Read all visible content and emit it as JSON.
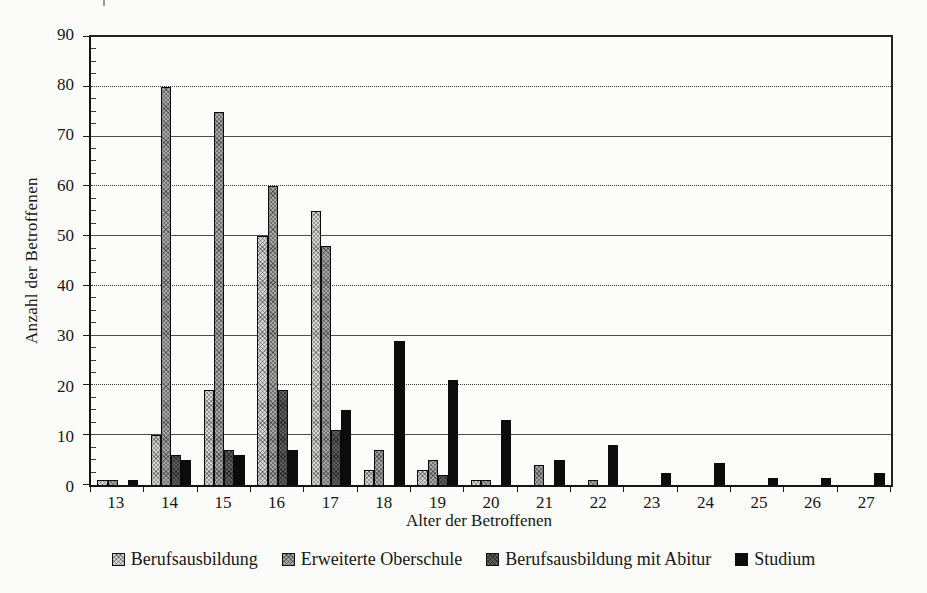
{
  "chart_data": {
    "type": "bar",
    "title": "",
    "xlabel": "Alter der Betroffenen",
    "ylabel": "Anzahl der Betroffenen",
    "categories": [
      "13",
      "14",
      "15",
      "16",
      "17",
      "18",
      "19",
      "20",
      "21",
      "22",
      "23",
      "24",
      "25",
      "26",
      "27"
    ],
    "series": [
      {
        "name": "Berufsausbildung",
        "color": "#d2d2d2",
        "values": [
          1,
          10,
          19,
          50,
          55,
          3,
          3,
          1,
          0,
          0,
          0,
          0,
          0,
          0,
          0
        ]
      },
      {
        "name": "Erweiterte Oberschule",
        "color": "#9b9b9b",
        "values": [
          1,
          80,
          75,
          60,
          48,
          7,
          5,
          1,
          4,
          1,
          0,
          0,
          0,
          0,
          0
        ]
      },
      {
        "name": "Berufsausbildung mit Abitur",
        "color": "#4a4a4a",
        "values": [
          0,
          6,
          7,
          19,
          11,
          0,
          2,
          0,
          0,
          0,
          0,
          0,
          0,
          0,
          0
        ]
      },
      {
        "name": "Studium",
        "color": "#0c0c0c",
        "values": [
          1,
          5,
          6,
          7,
          15,
          29,
          21,
          13,
          5,
          8,
          2.5,
          4.5,
          1.5,
          1.5,
          2.5
        ]
      }
    ],
    "ylim": [
      0,
      90
    ],
    "ytick_step": 10,
    "ytick_labels": [
      "0",
      "10",
      "20",
      "30",
      "40",
      "50",
      "60",
      "70",
      "80",
      "90"
    ],
    "yminor_step": 2.5,
    "legend_position": "bottom",
    "grid": "horizontal"
  }
}
